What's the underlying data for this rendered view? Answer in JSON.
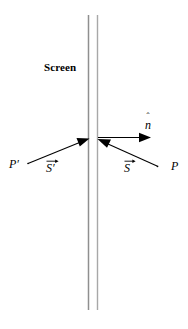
{
  "figure": {
    "background_color": "#ffffff",
    "stroke_color": "#000000",
    "screen_line_color": "#8c8c8c",
    "width": 188,
    "height": 329
  },
  "screen": {
    "label": "Screen",
    "label_position": {
      "x": 44,
      "y": 62
    },
    "line1_x": 88,
    "line2_x": 97,
    "line_top_y": 15,
    "line_bottom_y": 310,
    "line_width": 1.4,
    "color": "#8c8c8c"
  },
  "incidence_point": {
    "x": 93,
    "y": 140
  },
  "rays": [
    {
      "name": "incident-ray-s-prime",
      "label": "S",
      "has_vector_arrow": true,
      "has_prime": true,
      "label_text": "S⃗′",
      "from": {
        "x": 28,
        "y": 163
      },
      "to": {
        "x": 88,
        "y": 139
      },
      "arrowhead": "at-screen",
      "label_position": {
        "x": 46,
        "y": 158
      },
      "endpoint_label": "P′",
      "endpoint_label_position": {
        "x": 9,
        "y": 158
      }
    },
    {
      "name": "incident-ray-s",
      "label": "S",
      "has_vector_arrow": true,
      "has_prime": false,
      "label_text": "S⃗",
      "from": {
        "x": 157,
        "y": 166
      },
      "to": {
        "x": 98,
        "y": 140
      },
      "arrowhead": "at-screen",
      "label_position": {
        "x": 124,
        "y": 158
      },
      "endpoint_label": "P",
      "endpoint_label_position": {
        "x": 171,
        "y": 160
      }
    }
  ],
  "normal": {
    "name": "normal-vector-n-hat",
    "label_text": "n̂",
    "base_letter": "n",
    "hat": "^",
    "from": {
      "x": 98,
      "y": 138
    },
    "to": {
      "x": 150,
      "y": 138
    },
    "label_position": {
      "x": 145,
      "y": 114
    }
  },
  "labels": {
    "screen": "Screen",
    "p_prime": "P′",
    "p": "P",
    "s_prime_vector": "S⃗′",
    "s_vector": "S⃗",
    "n_hat": "n̂",
    "s_base": "S",
    "n_base": "n",
    "prime_glyph": "′",
    "hat_glyph": "ˆ"
  }
}
